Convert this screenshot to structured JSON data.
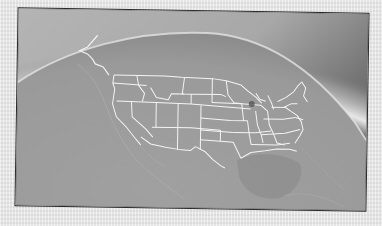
{
  "image": {
    "description": "Grayscale view of Earth from space showing North America with white US state borders, framed photo",
    "colors": {
      "space_top": "#9a9a9a",
      "atmosphere_glow": "#e8e8e8",
      "corner_dark": "#5a5a5a",
      "land_ocean": "#9c9c9c",
      "gulf": "#8e8e8e",
      "borders": "#f2f2f2",
      "frame": "#2a2a2a",
      "paper": "#e6e6e6",
      "marker_dot": "#555555"
    },
    "features": [
      "globe-horizon",
      "atmosphere-glow",
      "us-state-borders",
      "coastline",
      "gulf-of-mexico",
      "location-marker-dot"
    ]
  }
}
